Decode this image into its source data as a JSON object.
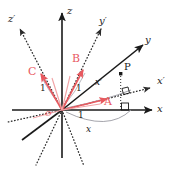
{
  "figure": {
    "kind": "3d-coordinate-axes-diagram",
    "width": 178,
    "height": 170,
    "background": "#ffffff",
    "colors": {
      "axis": "#1a1a1a",
      "vector": "#e8595f",
      "arc": "#9a9aa2",
      "dotted_axis": "#2b2b2b"
    }
  },
  "axes": {
    "unprimed": [
      {
        "name": "x-axis",
        "label": "x",
        "style": "solid",
        "direction": "right"
      },
      {
        "name": "y-axis",
        "label": "y",
        "style": "solid",
        "direction": "upper-right"
      },
      {
        "name": "z-axis",
        "label": "z",
        "style": "solid",
        "direction": "up"
      }
    ],
    "primed": [
      {
        "name": "x-prime-axis",
        "label": "x",
        "prime": "′",
        "style": "dotted",
        "direction": "right-slightly-up"
      },
      {
        "name": "y-prime-axis",
        "label": "y",
        "prime": "′",
        "style": "dotted",
        "direction": "upper-right-steep"
      },
      {
        "name": "z-prime-axis",
        "label": "z",
        "prime": "′",
        "style": "dotted",
        "direction": "upper-left"
      }
    ]
  },
  "vectors": [
    {
      "name": "vector-A",
      "label": "A",
      "length_label": "1",
      "color": "#e8595f",
      "direction": "toward-x-prime"
    },
    {
      "name": "vector-B",
      "label": "B",
      "length_label": "1",
      "color": "#e8595f",
      "direction": "toward-y-prime"
    },
    {
      "name": "vector-C",
      "label": "C",
      "length_label": "1",
      "color": "#e8595f",
      "direction": "toward-z-prime"
    }
  ],
  "points": [
    {
      "name": "point-P",
      "label": "P"
    },
    {
      "name": "origin",
      "label": "O"
    }
  ],
  "arc_labels": [
    {
      "name": "arc-x-prime-label",
      "label": "x",
      "prime": "′"
    },
    {
      "name": "arc-x-label",
      "label": "x",
      "prime": ""
    }
  ],
  "unit_labels": [
    "1",
    "1",
    "1"
  ],
  "right_angles": [
    {
      "name": "right-angle-x-prime-projection"
    },
    {
      "name": "right-angle-x-projection"
    }
  ]
}
